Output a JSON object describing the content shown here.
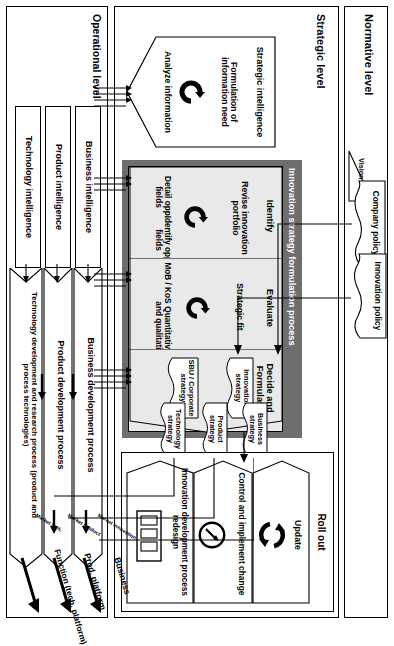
{
  "diagram": {
    "type": "process-flow-diagram",
    "orientation": "rotated-90-clockwise",
    "colors": {
      "band_fill": "#6e6e6e",
      "phase_fill": "#e9e9e9",
      "line": "#000000",
      "background": "#ffffff"
    }
  },
  "levels": {
    "normative": {
      "label": "Normative level"
    },
    "strategic": {
      "label": "Strategic level"
    },
    "operational": {
      "label": "Operational level"
    }
  },
  "normative": {
    "vision": "Vision",
    "company_policy": "Company policy",
    "innovation_policy": "Innovation policy"
  },
  "strategic": {
    "band_label": "Innovation strategy formulation process",
    "intelligence": {
      "title": "Strategic intelligence",
      "item_1": "Formulation of information need",
      "item_2": "Analyze information",
      "icon": "loop-arrow-icon"
    },
    "phases": [
      {
        "name": "Identify",
        "center": "Revise innovation portfolio",
        "left": "Detail opp. fields",
        "right": "Identify opp. fields",
        "icon": "loop-arrow-icon"
      },
      {
        "name": "Evaluate",
        "center": "Strategic fit",
        "left": "MoB / KoS",
        "right": "Quantitative and qualitative",
        "icon": "loop-arrow-icon"
      },
      {
        "name": "Decide and Formulate",
        "center": "",
        "left": "",
        "right": "",
        "icon": ""
      }
    ],
    "decide_strategies": {
      "innovation_strategy": "Innovation strategy",
      "sbu_corporate_strategy": "SBU / Corporate strategy",
      "business_strategy": "Business strategy",
      "product_strategy": "Product strategy",
      "technology_strategy": "Technology strategy"
    },
    "rollout": {
      "title": "Roll out",
      "update": "Update",
      "control": "Control and implement change",
      "redesign": "Innovation development process redesign",
      "update_icon": "recycle-loop-icon",
      "control_icon": "gauge-icon",
      "redesign_icon": "process-columns-icon"
    }
  },
  "operational": {
    "processes": [
      {
        "label": "Business development process",
        "output": "Business",
        "marker": "Market innovation"
      },
      {
        "label": "Product development process",
        "output": "Prod. platform",
        "marker": "Market product"
      },
      {
        "label": "Technology development and research process (product and process technologies)",
        "output": "Function (tech. platform)",
        "marker": "Market tech."
      }
    ],
    "intelligence": [
      "Business intelligence",
      "Product intelligence",
      "Technology intelligence"
    ]
  }
}
